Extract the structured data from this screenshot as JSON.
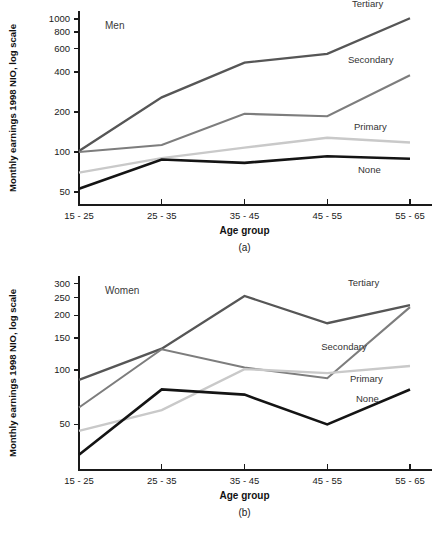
{
  "figure": {
    "panels": [
      {
        "caption": "(a)",
        "group_label": "Men",
        "xlabel": "Age group",
        "ylabel": "Monthly earnings 1998 NIO, log scale"
      },
      {
        "caption": "(b)",
        "group_label": "Women",
        "xlabel": "Age group",
        "ylabel": "Monthly earnings 1998 NIO, log scale"
      }
    ]
  },
  "colors": {
    "tertiary": "#565656",
    "secondary": "#7d7d7d",
    "primary": "#c9c9c9",
    "none": "#141414",
    "axis": "#1a1a1a"
  },
  "chart_data": [
    {
      "type": "line",
      "title": "Men",
      "panel": "(a)",
      "xlabel": "Age group",
      "ylabel": "Monthly earnings 1998 NIO, log scale",
      "yscale": "log",
      "ylim": [
        40,
        1150
      ],
      "yticks": [
        50,
        100,
        200,
        400,
        600,
        800,
        1000
      ],
      "ytick_labels": [
        "50",
        "100",
        "200",
        "400",
        "600",
        "800",
        "1000"
      ],
      "grid": false,
      "legend": "inline-right",
      "categories": [
        "15 - 25",
        "25 - 35",
        "35 - 45",
        "45 - 55",
        "55 - 65"
      ],
      "series": [
        {
          "name": "Tertiary",
          "values": [
            102,
            258,
            470,
            548,
            1015
          ]
        },
        {
          "name": "Secondary",
          "values": [
            100,
            113,
            194,
            186,
            378
          ]
        },
        {
          "name": "Primary",
          "values": [
            70,
            90,
            108,
            128,
            118
          ]
        },
        {
          "name": "None",
          "values": [
            53,
            88,
            83,
            93,
            89
          ]
        }
      ]
    },
    {
      "type": "line",
      "title": "Women",
      "panel": "(b)",
      "xlabel": "Age group",
      "ylabel": "Monthly earnings 1998 NIO, log scale",
      "yscale": "log",
      "ylim": [
        28,
        330
      ],
      "yticks": [
        50,
        100,
        150,
        200,
        250,
        300
      ],
      "ytick_labels": [
        "50",
        "100",
        "150",
        "200",
        "250",
        "300"
      ],
      "grid": false,
      "legend": "inline-right",
      "categories": [
        "15 - 25",
        "25 - 35",
        "35 - 45",
        "45 - 55",
        "55 - 65"
      ],
      "series": [
        {
          "name": "Tertiary",
          "values": [
            88,
            131,
            256,
            181,
            228
          ]
        },
        {
          "name": "Secondary",
          "values": [
            62,
            130,
            103,
            90,
            222
          ]
        },
        {
          "name": "Primary",
          "values": [
            46,
            60,
            101,
            96,
            105
          ]
        },
        {
          "name": "None",
          "values": [
            34,
            78,
            73,
            50,
            78
          ]
        }
      ]
    }
  ]
}
